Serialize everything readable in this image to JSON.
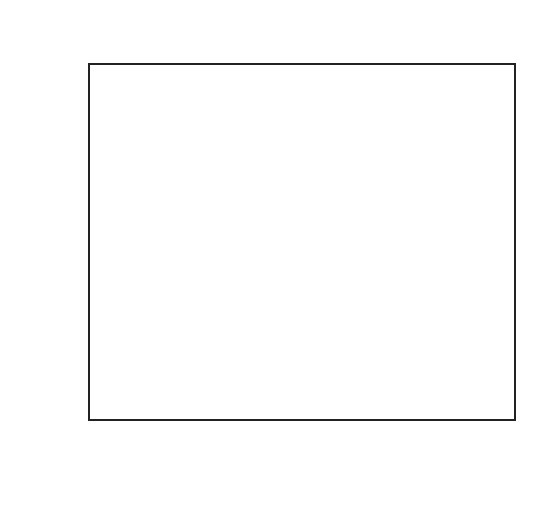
{
  "chart_data": {
    "type": "line",
    "panel_label": "(c)",
    "title": "",
    "xlabel": "Z",
    "ylabel": "β",
    "xlim": [
      0,
      1
    ],
    "ylim": [
      0,
      10
    ],
    "xticks": [
      0,
      0.2,
      0.4,
      0.6,
      0.8,
      1
    ],
    "xtick_labels": [
      "0",
      "0.2",
      "0.4",
      "0.6",
      "0.8",
      "1"
    ],
    "yticks": [
      0,
      2,
      4,
      6,
      8,
      10
    ],
    "ytick_labels": [
      "0",
      "2",
      "4",
      "6",
      "8",
      "10"
    ],
    "grid": false,
    "legend": "none (inline annotations)",
    "annotations": [
      {
        "text": "Φ = 0.1",
        "x": 0.5,
        "y": 10.3
      },
      {
        "text": "Φ = 1",
        "x": 0.5,
        "y": 9.15
      },
      {
        "text": "Φ = 4",
        "x": 0.5,
        "y": 5.5
      },
      {
        "text": "Φ = 10",
        "x": 0.5,
        "y": 0.55
      }
    ],
    "series": [
      {
        "name": "Φ = 0.1 (solid)",
        "style": "solid",
        "boundary": 10,
        "min_at_0.5": 9.99
      },
      {
        "name": "Φ = 0.1 (dashed)",
        "style": "dashed",
        "boundary": 10,
        "min_at_0.5": 9.96
      },
      {
        "name": "Φ = 1 (dashed)",
        "style": "dashed",
        "boundary": 10,
        "min_at_0.5": 8.9
      },
      {
        "name": "Φ = 1 (solid)",
        "style": "solid",
        "boundary": 10,
        "min_at_0.5": 8.2
      },
      {
        "name": "Φ = 4 (dashed)",
        "style": "dashed",
        "boundary": 10,
        "min_at_0.5": 2.65
      },
      {
        "name": "Φ = 4 (solid)",
        "style": "solid",
        "boundary": 10,
        "min_at_0.5": 1.4
      },
      {
        "name": "Φ = 10 (dashed)",
        "style": "dashed",
        "boundary": 10,
        "min_at_0.5": 0.12
      }
    ],
    "x": [
      0,
      0.1,
      0.2,
      0.3,
      0.4,
      0.5,
      0.6,
      0.7,
      0.8,
      0.9,
      1.0
    ]
  }
}
